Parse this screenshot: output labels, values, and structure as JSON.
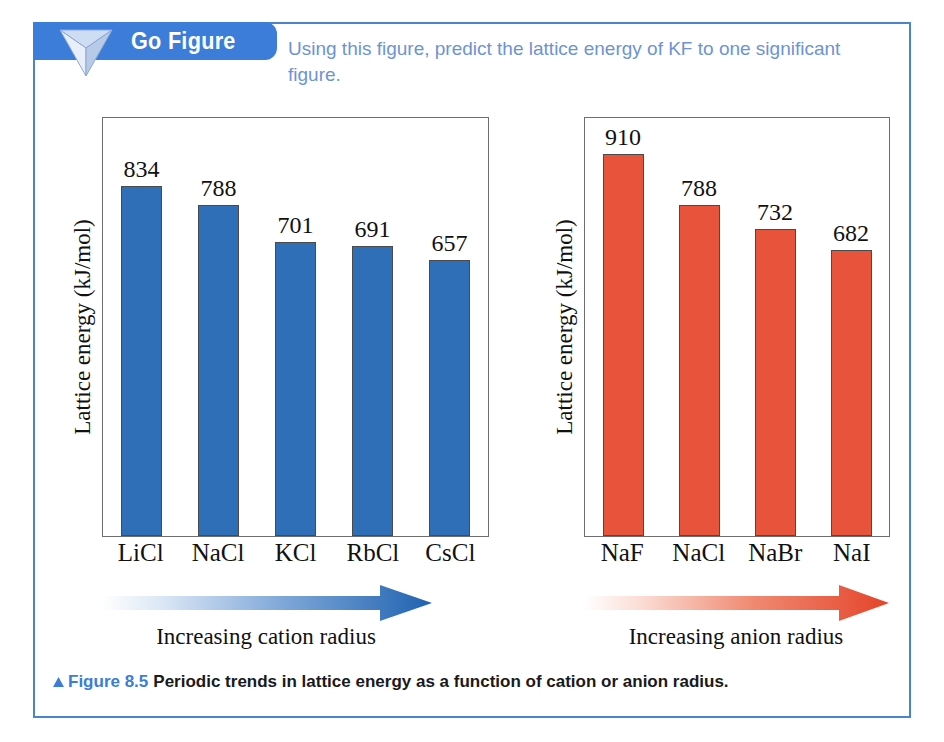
{
  "banner": {
    "label": "Go Figure",
    "icon": "inverted-pyramid-icon",
    "color": "#3b7dd8"
  },
  "prompt": {
    "text": "Using this figure, predict the lattice energy of KF to one significant figure.",
    "color": "#6d93d4"
  },
  "caption": {
    "triangle": "▲",
    "figure_number": "Figure 8.5",
    "text": "Periodic trends in lattice energy as a function of cation or anion radius.",
    "number_color": "#3b7dd8"
  },
  "trends": {
    "left": {
      "caption": "Increasing cation radius",
      "color": "#2e6fb7"
    },
    "right": {
      "caption": "Increasing anion radius",
      "color": "#e8543b"
    }
  },
  "chart_data": [
    {
      "type": "bar",
      "id": "cation-chart",
      "title": "",
      "xlabel": "Increasing cation radius",
      "ylabel": "Lattice energy (kJ/mol)",
      "categories": [
        "LiCl",
        "NaCl",
        "KCl",
        "RbCl",
        "CsCl"
      ],
      "values": [
        834,
        788,
        701,
        691,
        657
      ],
      "ylim": [
        0,
        1000
      ],
      "grid": false,
      "legend": "none",
      "bar_color": "#2e6fb7"
    },
    {
      "type": "bar",
      "id": "anion-chart",
      "title": "",
      "xlabel": "Increasing anion radius",
      "ylabel": "Lattice energy (kJ/mol)",
      "categories": [
        "NaF",
        "NaCl",
        "NaBr",
        "NaI"
      ],
      "values": [
        910,
        788,
        732,
        682
      ],
      "ylim": [
        0,
        1000
      ],
      "grid": false,
      "legend": "none",
      "bar_color": "#e8543b"
    }
  ]
}
